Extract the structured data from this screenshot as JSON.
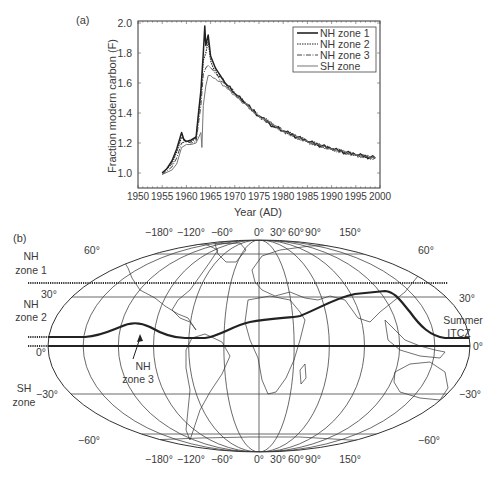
{
  "panel_a": {
    "label": "(a)",
    "ylabel": "Fraction modern carbon (F)",
    "xlabel": "Year (AD)",
    "yticks": [
      "1.0",
      "1.2",
      "1.4",
      "1.6",
      "1.8",
      "2.0"
    ],
    "xticks": [
      "1950",
      "1955",
      "1960",
      "1965",
      "1970",
      "1975",
      "1980",
      "1985",
      "1990",
      "1995",
      "2000"
    ],
    "legend": [
      "NH zone 1",
      "NH zone 2",
      "NH zone 3",
      "SH zone"
    ]
  },
  "panel_b": {
    "label": "(b)",
    "zone_labels": {
      "nh1_line1": "NH",
      "nh1_line2": "zone 1",
      "nh2_line1": "NH",
      "nh2_line2": "zone 2",
      "nh3_line1": "NH",
      "nh3_line2": "zone 3",
      "sh_line1": "SH",
      "sh_line2": "zone"
    },
    "itcz_line1": "Summer",
    "itcz_line2": "ITCZ",
    "lon_labels": [
      "−180°",
      "−120°",
      "−60°",
      "0°",
      "30°",
      "60°",
      "90°",
      "150°"
    ],
    "lat_labels_left": [
      "60°",
      "30°",
      "0°",
      "−30°",
      "−60°"
    ],
    "lat_labels_right": [
      "60°",
      "30°",
      "0°",
      "−30°",
      "−60°"
    ]
  },
  "chart_data": [
    {
      "type": "line",
      "title": "(a)",
      "xlabel": "Year (AD)",
      "ylabel": "Fraction modern carbon (F)",
      "xlim": [
        1950,
        2000
      ],
      "ylim": [
        0.9,
        2.0
      ],
      "grid": false,
      "legend_position": "upper right",
      "series": [
        {
          "name": "NH zone 1",
          "style": "solid-thick",
          "x": [
            1955,
            1956,
            1957,
            1958,
            1959,
            1959.5,
            1960,
            1961,
            1962,
            1962.5,
            1963,
            1963.5,
            1963.8,
            1964,
            1964.5,
            1965,
            1966,
            1967,
            1968,
            1970,
            1972,
            1975,
            1978,
            1980,
            1985,
            1990,
            1995,
            1999
          ],
          "y": [
            1.0,
            1.03,
            1.08,
            1.16,
            1.27,
            1.22,
            1.21,
            1.22,
            1.24,
            1.4,
            1.55,
            1.8,
            1.98,
            1.85,
            1.92,
            1.78,
            1.7,
            1.65,
            1.6,
            1.53,
            1.47,
            1.38,
            1.31,
            1.28,
            1.21,
            1.16,
            1.12,
            1.1
          ]
        },
        {
          "name": "NH zone 2",
          "style": "dotted",
          "x": [
            1955,
            1957,
            1958,
            1959,
            1960,
            1961,
            1962,
            1962.5,
            1963,
            1963.5,
            1964,
            1964.5,
            1965,
            1966,
            1968,
            1970,
            1975,
            1980,
            1985,
            1990,
            1995,
            1999
          ],
          "y": [
            1.0,
            1.06,
            1.14,
            1.24,
            1.21,
            1.21,
            1.23,
            1.38,
            1.52,
            1.75,
            1.8,
            1.88,
            1.75,
            1.68,
            1.6,
            1.53,
            1.38,
            1.28,
            1.21,
            1.16,
            1.12,
            1.1
          ]
        },
        {
          "name": "NH zone 3",
          "style": "dash-dot",
          "x": [
            1955,
            1957,
            1958,
            1959,
            1960,
            1961,
            1962,
            1963,
            1963.5,
            1964,
            1964.5,
            1965,
            1966,
            1968,
            1970,
            1975,
            1980,
            1985,
            1990,
            1995,
            1999
          ],
          "y": [
            0.99,
            1.04,
            1.1,
            1.2,
            1.21,
            1.2,
            1.21,
            1.45,
            1.66,
            1.7,
            1.72,
            1.7,
            1.66,
            1.59,
            1.53,
            1.38,
            1.28,
            1.21,
            1.16,
            1.12,
            1.1
          ]
        },
        {
          "name": "SH zone",
          "style": "solid-thin",
          "x": [
            1955,
            1957,
            1958,
            1959,
            1960,
            1961,
            1962,
            1963,
            1963.2,
            1963.5,
            1964,
            1964.5,
            1965,
            1966,
            1968,
            1970,
            1975,
            1980,
            1985,
            1990,
            1995,
            1999
          ],
          "y": [
            0.99,
            1.02,
            1.06,
            1.17,
            1.19,
            1.19,
            1.2,
            1.27,
            1.17,
            1.45,
            1.58,
            1.65,
            1.65,
            1.63,
            1.58,
            1.52,
            1.38,
            1.28,
            1.21,
            1.16,
            1.12,
            1.1
          ]
        }
      ]
    },
    {
      "type": "map",
      "title": "(b)",
      "projection": "Robinson-like world map",
      "meridians_deg": [
        -180,
        -150,
        -120,
        -90,
        -60,
        -30,
        0,
        30,
        60,
        90,
        120,
        150,
        180
      ],
      "parallels_deg": [
        60,
        30,
        0,
        -30,
        -60
      ],
      "zones": [
        {
          "name": "NH zone 1",
          "from_lat": 90,
          "to_lat": 38
        },
        {
          "name": "NH zone 2",
          "from_lat": 38,
          "to_lat": "Summer ITCZ"
        },
        {
          "name": "NH zone 3",
          "from_lat": "Summer ITCZ",
          "to_lat": 0
        },
        {
          "name": "SH zone",
          "from_lat": 0,
          "to_lat": -90
        }
      ],
      "summer_itcz_approx": {
        "lon": [
          -180,
          -150,
          -120,
          -90,
          -60,
          -30,
          0,
          30,
          60,
          90,
          120,
          150,
          180
        ],
        "lat": [
          5,
          5,
          12,
          5,
          5,
          10,
          15,
          18,
          28,
          32,
          30,
          10,
          5
        ]
      }
    }
  ]
}
